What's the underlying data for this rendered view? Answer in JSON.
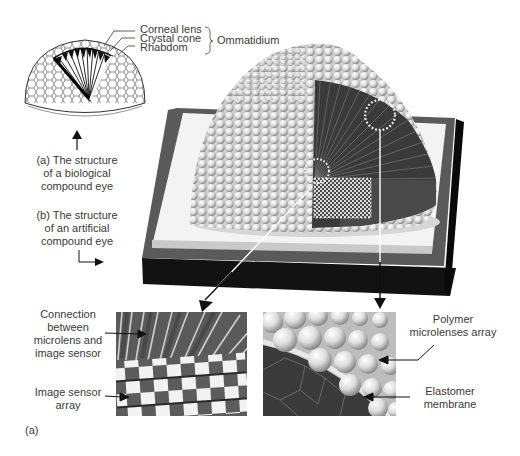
{
  "figure": {
    "panel_label": "(a)",
    "biological_eye": {
      "parts": [
        "Corneal lens",
        "Crystal cone",
        "Rhabdom"
      ],
      "group_label": "Ommatidium",
      "caption_lines": [
        "(a) The structure",
        "of a biological",
        "compound eye"
      ]
    },
    "artificial_eye": {
      "caption_lines": [
        "(b) The structure",
        "of an artificial",
        "compound eye"
      ]
    },
    "inset_left": {
      "labels": [
        {
          "lines": [
            "Connection",
            "between",
            "microlens and",
            "image sensor"
          ]
        },
        {
          "lines": [
            "Image sensor",
            "array"
          ]
        }
      ]
    },
    "inset_right": {
      "labels": [
        {
          "lines": [
            "Polymer",
            "microlenses array"
          ]
        },
        {
          "lines": [
            "Elastomer",
            "membrane"
          ]
        }
      ]
    }
  },
  "colors": {
    "ink": "#1a1a1a",
    "text": "#3a3a3a",
    "base_dark": "#121212",
    "base_border": "#5a5a5a",
    "base_light": "#f4f4f4",
    "cut_face": "#3c3c3c",
    "lens": "#e6e6e6"
  }
}
